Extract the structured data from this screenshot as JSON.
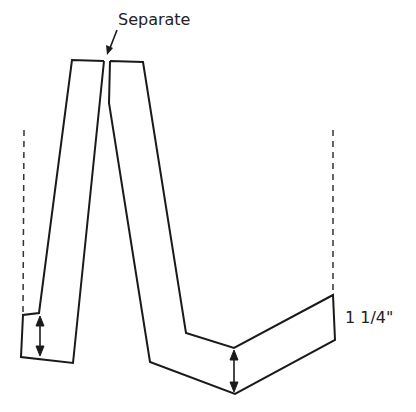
{
  "diagram": {
    "separate_label": "Separate",
    "dimension_label": "1 1/4\"",
    "colors": {
      "line": "#1a1a1a",
      "background": "#ffffff"
    }
  }
}
